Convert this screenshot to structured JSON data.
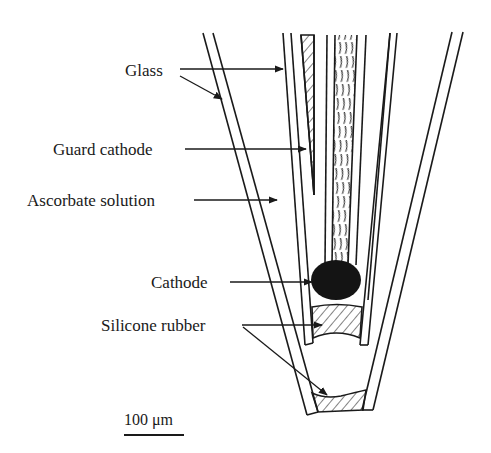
{
  "figure": {
    "type": "schematic",
    "labels": {
      "glass": "Glass",
      "guard_cathode": "Guard cathode",
      "ascorbate_solution": "Ascorbate solution",
      "cathode": "Cathode",
      "silicone_rubber": "Silicone rubber"
    },
    "scale_bar": {
      "value": "100",
      "unit": "μm",
      "label": "100 μm"
    },
    "colors": {
      "line": "#1a1a1a",
      "cathode_fill": "#141414",
      "background": "#ffffff"
    }
  }
}
